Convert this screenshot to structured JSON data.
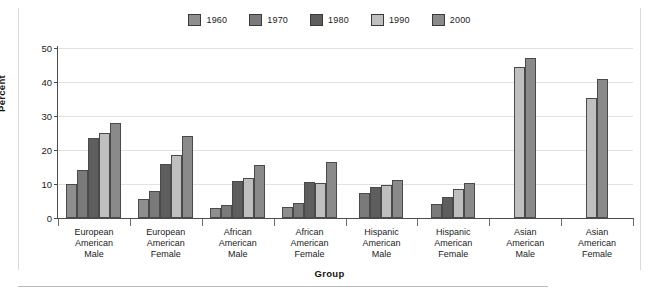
{
  "chart_data": {
    "type": "bar",
    "title": "",
    "xlabel": "Group",
    "ylabel": "Percent",
    "ylim": [
      0,
      50
    ],
    "yticks": [
      0,
      10,
      20,
      30,
      40,
      50
    ],
    "grid": true,
    "legend_position": "top-center",
    "categories": [
      "European American Male",
      "European American Female",
      "African American Male",
      "African American Female",
      "Hispanic American Male",
      "Hispanic American Female",
      "Asian American Male",
      "Asian American Female"
    ],
    "category_lines": [
      [
        "European",
        "American",
        "Male"
      ],
      [
        "European",
        "American",
        "Female"
      ],
      [
        "African",
        "American",
        "Male"
      ],
      [
        "African",
        "American",
        "Female"
      ],
      [
        "Hispanic",
        "American",
        "Male"
      ],
      [
        "Hispanic",
        "American",
        "Female"
      ],
      [
        "Asian",
        "American",
        "Male"
      ],
      [
        "Asian",
        "American",
        "Female"
      ]
    ],
    "series": [
      {
        "name": "1960",
        "color": "#8f8f8f",
        "values": [
          10.0,
          5.5,
          2.8,
          3.1,
          null,
          null,
          null,
          null
        ]
      },
      {
        "name": "1970",
        "color": "#7a7a7a",
        "values": [
          14.1,
          8.0,
          3.8,
          4.4,
          7.5,
          4.0,
          null,
          null
        ]
      },
      {
        "name": "1980",
        "color": "#5e5e5e",
        "values": [
          23.4,
          16.0,
          11.0,
          10.5,
          9.0,
          6.3,
          null,
          null
        ]
      },
      {
        "name": "1990",
        "color": "#bfbfbf",
        "values": [
          24.9,
          18.5,
          11.9,
          10.4,
          9.6,
          8.6,
          44.3,
          35.4
        ]
      },
      {
        "name": "2000",
        "color": "#8a8a8a",
        "values": [
          28.0,
          24.0,
          15.5,
          16.5,
          11.2,
          10.2,
          47.2,
          41.0
        ]
      }
    ]
  }
}
